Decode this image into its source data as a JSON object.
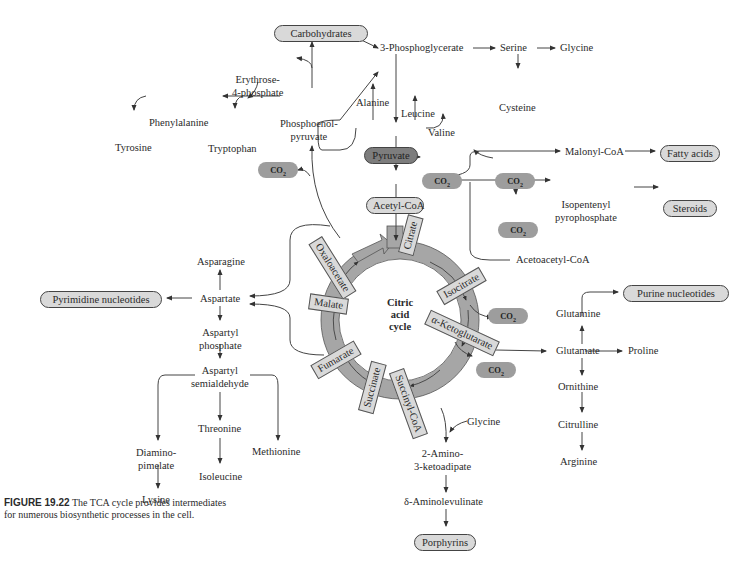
{
  "figure": {
    "number": "FIGURE 19.22",
    "caption": "The TCA cycle provides intermediates for numerous biosynthetic processes in the cell."
  },
  "cycle": {
    "center_label": [
      "Citric",
      "acid",
      "cycle"
    ],
    "intermediates": [
      "Citrate",
      "Isocitrate",
      "α-Ketoglutarate",
      "Succinyl-CoA",
      "Succinate",
      "Fumarate",
      "Malate",
      "Oxaloacetate"
    ]
  },
  "end_products": {
    "carbohydrates": "Carbohydrates",
    "fatty_acids": "Fatty acids",
    "steroids": "Steroids",
    "pyrimidine": "Pyrimidine nucleotides",
    "purine": "Purine nucleotides",
    "porphyrins": "Porphyrins"
  },
  "key_metabolites": {
    "pyruvate": "Pyruvate",
    "acetyl_coa": "Acetyl-CoA"
  },
  "co2_label": "CO",
  "co2_sub": "2",
  "nodes": {
    "phosphoglycerate": "3-Phosphoglycerate",
    "serine": "Serine",
    "glycine_top": "Glycine",
    "cysteine": "Cysteine",
    "erythrose": "Erythrose-",
    "erythrose2": "4-phosphate",
    "phenylalanine": "Phenylalanine",
    "tyrosine": "Tyrosine",
    "tryptophan": "Tryptophan",
    "pep1": "Phosphoenol-",
    "pep2": "pyruvate",
    "alanine": "Alanine",
    "leucine": "Leucine",
    "valine": "Valine",
    "malonyl": "Malonyl-CoA",
    "isopentenyl1": "Isopentenyl",
    "isopentenyl2": "pyrophosphate",
    "acetoacetyl": "Acetoacetyl-CoA",
    "asparagine": "Asparagine",
    "aspartate": "Aspartate",
    "aspartyl_p1": "Aspartyl",
    "aspartyl_p2": "phosphate",
    "aspartyl_s1": "Aspartyl",
    "aspartyl_s2": "semialdehyde",
    "threonine": "Threonine",
    "isoleucine": "Isoleucine",
    "methionine": "Methionine",
    "diamino1": "Diamino-",
    "diamino2": "pimelate",
    "lysine": "Lysine",
    "glutamine": "Glutamine",
    "glutamate": "Glutamate",
    "proline": "Proline",
    "ornithine": "Ornithine",
    "citrulline": "Citrulline",
    "arginine": "Arginine",
    "glycine_bottom": "Glycine",
    "amino_keto1": "2-Amino-",
    "amino_keto2": "3-ketoadipate",
    "ala": "δ-Aminolevulinate"
  }
}
